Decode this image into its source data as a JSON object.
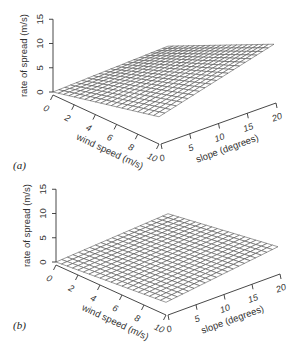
{
  "figure": {
    "panels": [
      {
        "id": "a",
        "label": "(a)"
      },
      {
        "id": "b",
        "label": "(b)"
      }
    ]
  },
  "chart_data": [
    {
      "type": "surface3d",
      "panel_label": "(a)",
      "title": "",
      "xlabel": "wind speed (m/s)",
      "ylabel": "slope (degrees)",
      "zlabel": "rate of spread (m/s)",
      "x_ticks": [
        0,
        2,
        4,
        6,
        8,
        10
      ],
      "y_ticks": [
        0,
        5,
        10,
        15,
        20
      ],
      "z_ticks": [
        0,
        5,
        10,
        15
      ],
      "xlim": [
        0,
        10
      ],
      "ylim": [
        0,
        20
      ],
      "zlim": [
        0,
        15
      ],
      "grid_lines": {
        "wind": 21,
        "slope": 21
      },
      "corner_values": {
        "wind0_slope0": 0.0,
        "wind10_slope0": 5.0,
        "wind0_slope20": 1.0,
        "wind10_slope20": 11.5
      },
      "description": "Rate of spread increases with both wind speed and slope, reaching about 11-12 m/s at wind 10 m/s and slope 20 degrees."
    },
    {
      "type": "surface3d",
      "panel_label": "(b)",
      "title": "",
      "xlabel": "wind speed (m/s)",
      "ylabel": "slope (degrees)",
      "zlabel": "rate of spread (m/s)",
      "x_ticks": [
        0,
        2,
        4,
        6,
        8,
        10
      ],
      "y_ticks": [
        0,
        5,
        10,
        15,
        20
      ],
      "z_ticks": [
        0,
        5,
        10,
        15
      ],
      "xlim": [
        0,
        10
      ],
      "ylim": [
        0,
        20
      ],
      "zlim": [
        0,
        15
      ],
      "grid_lines": {
        "wind": 21,
        "slope": 21
      },
      "corner_values": {
        "wind0_slope0": 0.0,
        "wind10_slope0": 2.0,
        "wind0_slope20": 1.5,
        "wind10_slope20": 5.0
      },
      "description": "Flatter surface; rate of spread rises gently with wind and slope, reaching about 5 m/s at the far corner."
    }
  ]
}
